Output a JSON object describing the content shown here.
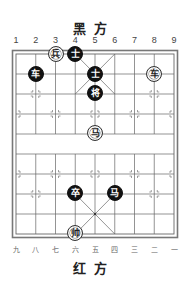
{
  "labels": {
    "top_side": "黑方",
    "bottom_side": "红方",
    "top_files": [
      "1",
      "2",
      "3",
      "4",
      "5",
      "6",
      "7",
      "8",
      "9"
    ],
    "bottom_files": [
      "九",
      "八",
      "七",
      "六",
      "五",
      "四",
      "三",
      "二",
      "一"
    ]
  },
  "board": {
    "columns": 9,
    "rows": 10,
    "origin_x": 16,
    "origin_y": 54,
    "col_spacing": 19.75,
    "row_spacing": 20,
    "line_color": "#555555",
    "black_piece_color": "#111111",
    "red_piece_color": "#ffffff"
  },
  "pieces": [
    {
      "side": "red",
      "glyph": "兵",
      "name": "red-soldier",
      "col": 2,
      "row": 0
    },
    {
      "side": "black",
      "glyph": "士",
      "name": "black-advisor",
      "col": 3,
      "row": 0
    },
    {
      "side": "black",
      "glyph": "车",
      "name": "black-chariot",
      "col": 1,
      "row": 1
    },
    {
      "side": "black",
      "glyph": "士",
      "name": "black-advisor",
      "col": 4,
      "row": 1
    },
    {
      "side": "red",
      "glyph": "车",
      "name": "red-chariot",
      "col": 7,
      "row": 1
    },
    {
      "side": "black",
      "glyph": "将",
      "name": "black-general",
      "col": 4,
      "row": 2
    },
    {
      "side": "red",
      "glyph": "马",
      "name": "red-horse",
      "col": 4,
      "row": 4
    },
    {
      "side": "black",
      "glyph": "卒",
      "name": "black-soldier",
      "col": 3,
      "row": 7
    },
    {
      "side": "black",
      "glyph": "马",
      "name": "black-horse",
      "col": 5,
      "row": 7
    },
    {
      "side": "red",
      "glyph": "帅",
      "name": "red-general",
      "col": 3,
      "row": 9
    }
  ]
}
